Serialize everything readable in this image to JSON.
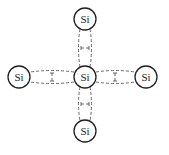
{
  "diagram": {
    "title": "",
    "atoms": [
      {
        "id": "center",
        "label": "Si",
        "cx": 85,
        "cy": 77
      },
      {
        "id": "top",
        "label": "Si",
        "cx": 85,
        "cy": 19
      },
      {
        "id": "left",
        "label": "Si",
        "cx": 19,
        "cy": 77
      },
      {
        "id": "right",
        "label": "Si",
        "cx": 146,
        "cy": 77
      },
      {
        "id": "bottom",
        "label": "Si",
        "cx": 85,
        "cy": 131
      }
    ],
    "bonds": [
      {
        "from": "center",
        "to": "top",
        "type": "covalent-shared-electron-pair",
        "style": "double dashed"
      },
      {
        "from": "center",
        "to": "left",
        "type": "covalent-shared-electron-pair",
        "style": "double dashed"
      },
      {
        "from": "center",
        "to": "right",
        "type": "covalent-shared-electron-pair",
        "style": "double dashed"
      },
      {
        "from": "center",
        "to": "bottom",
        "type": "covalent-shared-electron-pair",
        "style": "double dashed"
      }
    ],
    "atom_radius": 11,
    "colors": {
      "circle_stroke": "#222222",
      "bond_stroke": "#555555",
      "background": "#ffffff"
    }
  }
}
